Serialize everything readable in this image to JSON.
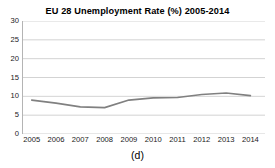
{
  "figure": {
    "caption": "(d)"
  },
  "chart_data": {
    "type": "line",
    "title": "EU 28 Unemployment Rate (%) 2005-2014",
    "xlabel": "",
    "ylabel": "",
    "categories": [
      "2005",
      "2006",
      "2007",
      "2008",
      "2009",
      "2010",
      "2011",
      "2012",
      "2013",
      "2014"
    ],
    "x": [
      2005,
      2006,
      2007,
      2008,
      2009,
      2010,
      2011,
      2012,
      2013,
      2014
    ],
    "values": [
      9.0,
      8.2,
      7.2,
      7.0,
      9.0,
      9.6,
      9.7,
      10.5,
      10.9,
      10.2
    ],
    "series": [
      {
        "name": "EU 28 Unemployment Rate (%)",
        "values": [
          9.0,
          8.2,
          7.2,
          7.0,
          9.0,
          9.6,
          9.7,
          10.5,
          10.9,
          10.2
        ],
        "color": "#808080"
      }
    ],
    "ylim": [
      0,
      30
    ],
    "yticks": [
      0,
      5,
      10,
      15,
      20,
      25,
      30
    ],
    "ytick_labels": [
      "0",
      "5",
      "10",
      "15",
      "20",
      "25",
      "30"
    ],
    "xlim": [
      2004.6,
      2014.6
    ],
    "grid": true,
    "grid_axis": "y",
    "grid_color": "#c8c8c8",
    "legend": false,
    "legend_position": "none",
    "line_color": "#808080",
    "line_width": 1.6,
    "markers": false,
    "background": "#ffffff"
  }
}
